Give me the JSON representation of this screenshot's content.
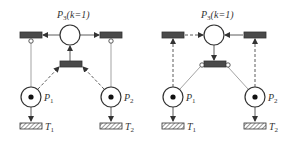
{
  "diagrams": [
    {
      "id": "left",
      "place_top": {
        "name": "P",
        "sub": "3",
        "suffix": "(k=1)"
      },
      "place_left": {
        "name": "P",
        "sub": "1",
        "tokens": 1
      },
      "place_right": {
        "name": "P",
        "sub": "2",
        "tokens": 1
      },
      "transition_left": {
        "name": "T",
        "sub": "1"
      },
      "transition_right": {
        "name": "T",
        "sub": "2"
      }
    },
    {
      "id": "right",
      "place_top": {
        "name": "P",
        "sub": "3",
        "suffix": "(k=1)"
      },
      "place_left": {
        "name": "P",
        "sub": "1",
        "tokens": 1
      },
      "place_right": {
        "name": "P",
        "sub": "2",
        "tokens": 1
      },
      "transition_left": {
        "name": "T",
        "sub": "1"
      },
      "transition_right": {
        "name": "T",
        "sub": "2"
      }
    }
  ],
  "colors": {
    "stroke": "#333333",
    "transition_fill": "#4a4a4a",
    "background": "#ffffff"
  }
}
